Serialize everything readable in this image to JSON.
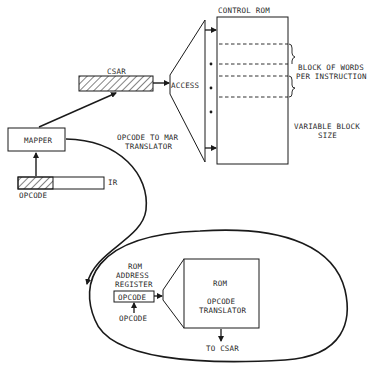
{
  "diagram": {
    "control_rom": {
      "title": "CONTROL ROM"
    },
    "csar": {
      "label": "CSAR"
    },
    "access": {
      "label": "ACCESS"
    },
    "brace_label": {
      "line1": "BLOCK OF WORDS",
      "line2": "PER INSTRUCTION"
    },
    "variable_label": {
      "line1": "VARIABLE BLOCK",
      "line2": "SIZE"
    },
    "mapper": {
      "label": "MAPPER"
    },
    "translator_label": {
      "line1": "OPCODE TO MAR",
      "line2": "TRANSLATOR"
    },
    "ir": {
      "label": "IR",
      "field_label": "OPCODE"
    },
    "rom_address_register": {
      "line1": "ROM",
      "line2": "ADDRESS",
      "line3": "REGISTER",
      "field": "OPCODE",
      "input_label": "OPCODE"
    },
    "rom_translator": {
      "line1": "ROM",
      "line2": "OPCODE",
      "line3": "TRANSLATOR"
    },
    "output_label": "TO CSAR",
    "colors": {
      "line": "#1a1a1a",
      "text": "#2a2a2a",
      "background": "#ffffff"
    }
  }
}
